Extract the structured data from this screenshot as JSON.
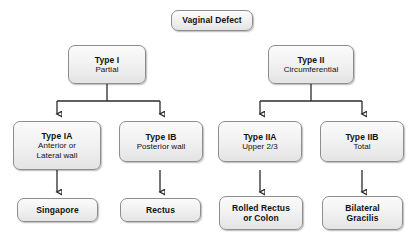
{
  "diagram": {
    "type": "flowchart",
    "background_color": "#ffffff",
    "node_fill_color": "#eeeeee",
    "node_border_color": "#8d8d8d",
    "connector_color": "#2b2b2b",
    "nodes": {
      "root": {
        "title": "Vaginal Defect",
        "subtitle": "",
        "subtitle2": ""
      },
      "type1": {
        "title": "Type I",
        "subtitle": "Partial",
        "subtitle2": ""
      },
      "type2": {
        "title": "Type II",
        "subtitle": "Circumferential",
        "subtitle2": ""
      },
      "type1a": {
        "title": "Type IA",
        "subtitle": "Anterior or",
        "subtitle2": "Lateral wall"
      },
      "type1b": {
        "title": "Type IB",
        "subtitle": "Posterior wall",
        "subtitle2": ""
      },
      "type2a": {
        "title": "Type IIA",
        "subtitle": "Upper 2/3",
        "subtitle2": ""
      },
      "type2b": {
        "title": "Type IIB",
        "subtitle": "Total",
        "subtitle2": ""
      },
      "flap1a": {
        "title": "Singapore",
        "subtitle": "",
        "subtitle2": ""
      },
      "flap1b": {
        "title": "Rectus",
        "subtitle": "",
        "subtitle2": ""
      },
      "flap2a": {
        "title": "Rolled Rectus",
        "subtitle": "or Colon",
        "subtitle2": ""
      },
      "flap2b": {
        "title": "Bilateral",
        "subtitle": "Gracilis",
        "subtitle2": ""
      }
    },
    "edges": [
      {
        "from": "type1",
        "to": "type1a"
      },
      {
        "from": "type1",
        "to": "type1b"
      },
      {
        "from": "type2",
        "to": "type2a"
      },
      {
        "from": "type2",
        "to": "type2b"
      },
      {
        "from": "type1a",
        "to": "flap1a"
      },
      {
        "from": "type1b",
        "to": "flap1b"
      },
      {
        "from": "type2a",
        "to": "flap2a"
      },
      {
        "from": "type2b",
        "to": "flap2b"
      }
    ]
  }
}
